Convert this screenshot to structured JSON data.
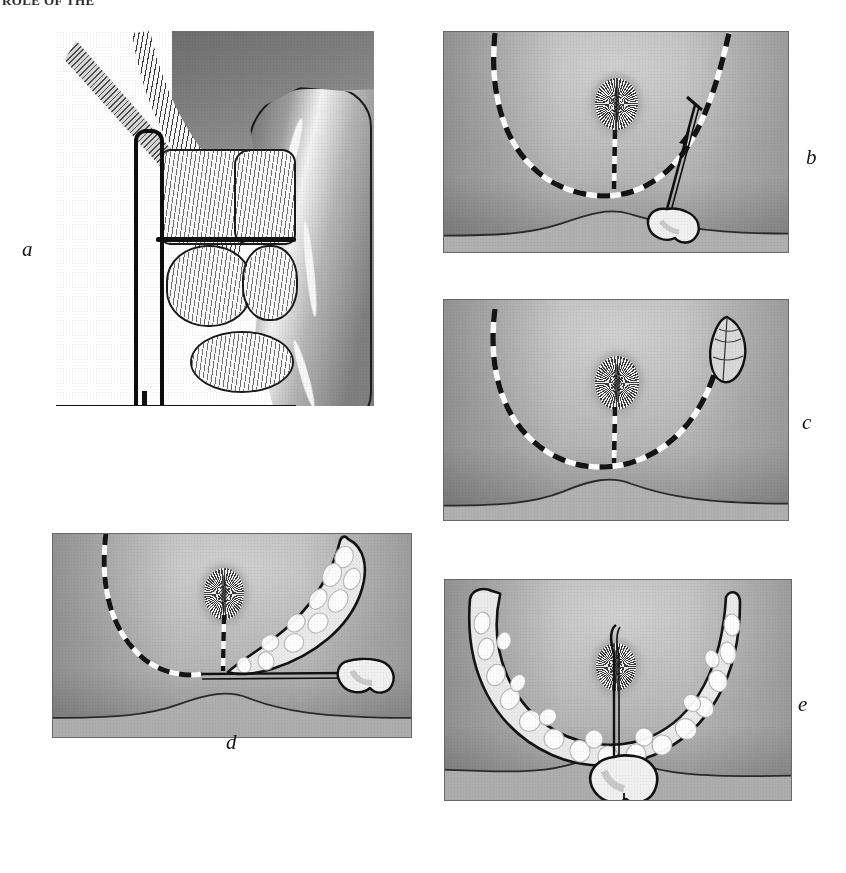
{
  "page": {
    "running_head": "ROLE OF THE",
    "figure_type": "surgical-technique-illustration",
    "panel_count": 5,
    "medium": "halftone line-and-wash drawing",
    "width": 846,
    "height": 873
  },
  "palette": {
    "paper": "#ffffff",
    "ink": "#111111",
    "skin_light": "#cfcfcf",
    "skin_mid": "#bdbdbd",
    "skin_shadow": "#8f8f8f",
    "plate_border": "#6a6a6a",
    "dash_dark": "#141414",
    "dash_light": "#fbfbfb",
    "fat_lobule": "#eeeeee",
    "muscle_grey": "#7a7a7a"
  },
  "panels": [
    {
      "id": "a",
      "label": "a",
      "label_position": "left-middle",
      "view": "sagittal cross-section",
      "description": "Sagittal section through the anal canal and rectum with a retractor in place.",
      "elements": [
        "striped levator-ani muscle band",
        "internal anal sphincter blocks",
        "external sphincter blocks",
        "retractor instrument",
        "rectal tube"
      ]
    },
    {
      "id": "b",
      "label": "b",
      "label_position": "right-middle",
      "view": "perineal surface",
      "description": "Perineum with U-shaped dashed incision outline, central anal verge and an obliquely placed needle carrying a flap marker.",
      "elements": [
        "U-shaped dashed incision line",
        "vertical midline dashed line",
        "anal rosette",
        "needle with suture",
        "heart-shaped tissue tag"
      ]
    },
    {
      "id": "c",
      "label": "c",
      "label_position": "right-middle",
      "view": "perineal surface",
      "description": "Same perineal field showing the dashed U incision with a leaf-shaped flap outline marked at the upper right limb.",
      "elements": [
        "U-shaped dashed incision line",
        "vertical midline dashed line",
        "anal rosette",
        "leaf-shaped flap outline"
      ]
    },
    {
      "id": "d",
      "label": "d",
      "label_position": "bottom-center",
      "view": "perineal surface",
      "description": "Right limb of the flap elevated, showing fat lobules on the undersurface, while the left limb remains marked by the dashed line.",
      "elements": [
        "dashed incision line remaining on left",
        "elevated crescent flap with fat lobules",
        "traction suture",
        "heart-shaped tissue tag",
        "anal rosette"
      ]
    },
    {
      "id": "e",
      "label": "e",
      "label_position": "right-middle",
      "view": "perineal surface",
      "description": "Both limbs of the U-shaped flap fully elevated as a single crescent of skin and subcutaneous fat, retracted downward on a traction suture.",
      "elements": [
        "fully elevated U-shaped flap with fat lobules",
        "central traction suture",
        "heart-shaped tissue tag",
        "anal rosette"
      ]
    }
  ]
}
